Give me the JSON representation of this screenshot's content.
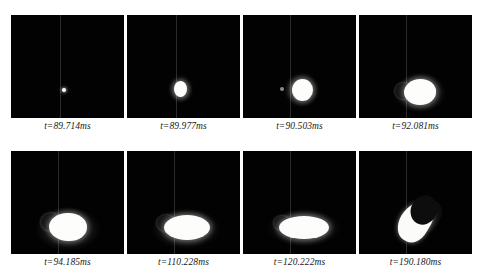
{
  "figure": {
    "type": "image-sequence",
    "layout": {
      "rows": 2,
      "columns": 4,
      "panel_count": 8
    },
    "background_color": "#ffffff",
    "frame_color": "#020202",
    "droplet_color": "#fdfdfb",
    "caption_color": "#1b1b1b",
    "reference_line_color": "#2b2b2b"
  },
  "panels": [
    {
      "index": 1,
      "time_value": "89.714",
      "time_unit": "ms",
      "symbol": "t",
      "equals": "=",
      "caption": "t=89.714ms",
      "description": "tiny bright point just right of the reference line"
    },
    {
      "index": 2,
      "time_value": "89.977",
      "time_unit": "ms",
      "symbol": "t",
      "equals": "=",
      "caption": "t=89.977ms",
      "description": "small round droplet on the reference line"
    },
    {
      "index": 3,
      "time_value": "90.503",
      "time_unit": "ms",
      "symbol": "t",
      "equals": "=",
      "caption": "t=90.503ms",
      "description": "larger round droplet with faint trailing speck"
    },
    {
      "index": 4,
      "time_value": "92.081",
      "time_unit": "ms",
      "symbol": "t",
      "equals": "=",
      "caption": "t=92.081ms",
      "description": "oval droplet elongating with dark lobe on the left"
    },
    {
      "index": 5,
      "time_value": "94.185",
      "time_unit": "ms",
      "symbol": "t",
      "equals": "=",
      "caption": "t=94.185ms",
      "description": "broader droplet straddling the reference line"
    },
    {
      "index": 6,
      "time_value": "110.228",
      "time_unit": "ms",
      "symbol": "t",
      "equals": "=",
      "caption": "t=110.228ms",
      "description": "horizontally stretched ellipse"
    },
    {
      "index": 7,
      "time_value": "120.222",
      "time_unit": "ms",
      "symbol": "t",
      "equals": "=",
      "caption": "t=120.222ms",
      "description": "wide flattened ellipse at maximum spread"
    },
    {
      "index": 8,
      "time_value": "190.180",
      "time_unit": "ms",
      "symbol": "t",
      "equals": "=",
      "caption": "t=190.180ms",
      "description": "curved crescent shaped ligament tilted to the right"
    }
  ]
}
